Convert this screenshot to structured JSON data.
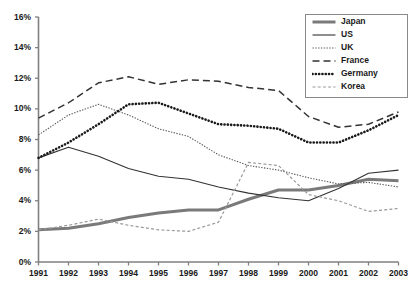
{
  "chart_data": {
    "type": "line",
    "title": "",
    "subtitle": "",
    "xlabel": "",
    "ylabel": "",
    "categories": [
      "1991",
      "1992",
      "1993",
      "1994",
      "1995",
      "1996",
      "1997",
      "1998",
      "1999",
      "2000",
      "2001",
      "2002",
      "2003"
    ],
    "x": [
      1991,
      1992,
      1993,
      1994,
      1995,
      1996,
      1997,
      1998,
      1999,
      2000,
      2001,
      2002,
      2003
    ],
    "xlim": [
      1991,
      2003
    ],
    "ylim": [
      0,
      16
    ],
    "ytick_labels": [
      "0%",
      "2%",
      "4%",
      "6%",
      "8%",
      "10%",
      "12%",
      "14%",
      "16%"
    ],
    "ytick_values": [
      0,
      2,
      4,
      6,
      8,
      10,
      12,
      14,
      16
    ],
    "grid": false,
    "legend_position": "top-right",
    "series": [
      {
        "name": "Japan",
        "style": "thick-solid",
        "color": "#7a7a7a",
        "values": [
          2.1,
          2.2,
          2.5,
          2.9,
          3.2,
          3.4,
          3.4,
          4.1,
          4.7,
          4.7,
          5.0,
          5.4,
          5.3
        ]
      },
      {
        "name": "US",
        "style": "thin-solid",
        "color": "#333333",
        "values": [
          6.8,
          7.5,
          6.9,
          6.1,
          5.6,
          5.4,
          4.9,
          4.5,
          4.2,
          4.0,
          4.8,
          5.8,
          6.0
        ]
      },
      {
        "name": "UK",
        "style": "fine-dotted",
        "color": "#5a5a5a",
        "values": [
          8.3,
          9.6,
          10.3,
          9.6,
          8.7,
          8.2,
          7.0,
          6.3,
          6.0,
          5.5,
          5.1,
          5.2,
          4.9
        ]
      },
      {
        "name": "France",
        "style": "dashed",
        "color": "#333333",
        "values": [
          9.4,
          10.4,
          11.7,
          12.1,
          11.6,
          11.9,
          11.8,
          11.4,
          11.2,
          9.5,
          8.8,
          9.0,
          9.8
        ]
      },
      {
        "name": "Germany",
        "style": "thick-dotted",
        "color": "#1a1a1a",
        "values": [
          6.8,
          7.8,
          9.0,
          10.3,
          10.4,
          9.7,
          9.0,
          8.9,
          8.7,
          7.8,
          7.8,
          8.6,
          9.6
        ]
      },
      {
        "name": "Korea",
        "style": "small-dashed",
        "color": "#999999",
        "values": [
          2.1,
          2.4,
          2.8,
          2.4,
          2.1,
          2.0,
          2.6,
          6.5,
          6.3,
          4.4,
          4.0,
          3.3,
          3.5
        ]
      }
    ],
    "legend": [
      {
        "label": "Japan",
        "style": "thick-solid"
      },
      {
        "label": "US",
        "style": "thin-solid"
      },
      {
        "label": "UK",
        "style": "fine-dotted"
      },
      {
        "label": "France",
        "style": "dashed"
      },
      {
        "label": "Germany",
        "style": "thick-dotted"
      },
      {
        "label": "Korea",
        "style": "small-dashed"
      }
    ]
  }
}
